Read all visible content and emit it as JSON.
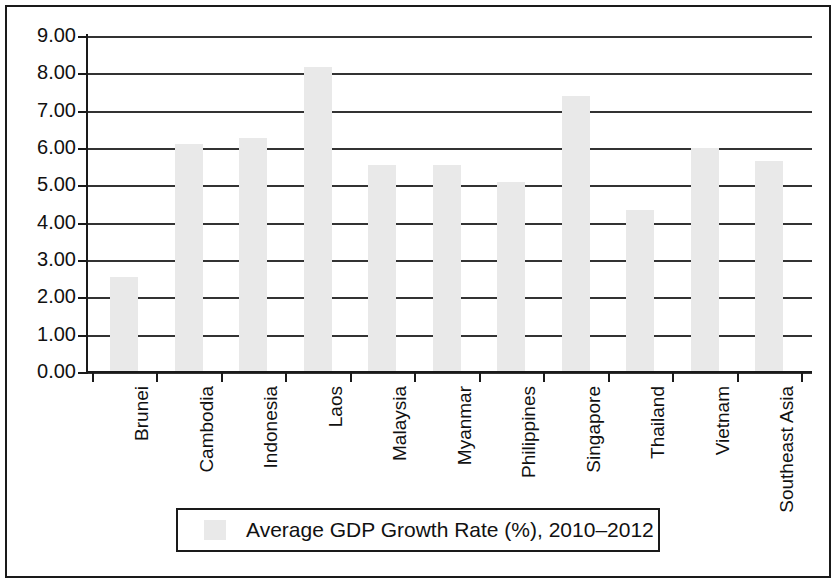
{
  "chart_data": {
    "type": "bar",
    "title": "",
    "subtitle": "",
    "xlabel": "",
    "ylabel": "",
    "ylim": [
      0,
      9
    ],
    "y_tick_step": 1,
    "grid": true,
    "grid_axis": "y",
    "legend_position": "bottom",
    "bar_color": "#e9e9e9",
    "axis_color": "#1a1a1a",
    "gridline_color": "#333333",
    "categories": [
      "Brunei",
      "Cambodia",
      "Indonesia",
      "Laos",
      "Malaysia",
      "Myanmar",
      "Philippines",
      "Singapore",
      "Thailand",
      "Vietnam",
      "Southeast Asia"
    ],
    "values": [
      2.55,
      6.1,
      6.27,
      8.17,
      5.55,
      5.55,
      5.1,
      7.4,
      4.35,
      6.0,
      5.65
    ],
    "series": [
      {
        "name": "Average GDP Growth Rate (%), 2010–2012",
        "values": [
          2.55,
          6.1,
          6.27,
          8.17,
          5.55,
          5.55,
          5.1,
          7.4,
          4.35,
          6.0,
          5.65
        ]
      }
    ],
    "y_tick_labels": [
      "9.00",
      "8.00",
      "7.00",
      "6.00",
      "5.00",
      "4.00",
      "3.00",
      "2.00",
      "1.00",
      "0.00"
    ],
    "y_tick_values": [
      9,
      8,
      7,
      6,
      5,
      4,
      3,
      2,
      1,
      0
    ],
    "legend": [
      "Average GDP Growth Rate (%), 2010–2012"
    ]
  },
  "legend": {
    "label": "Average GDP Growth Rate (%), 2010–2012"
  }
}
